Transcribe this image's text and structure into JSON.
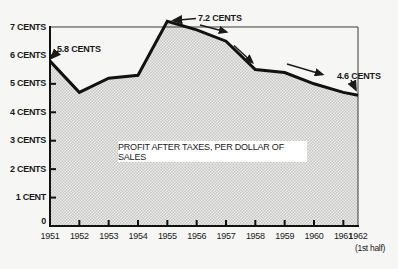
{
  "page": {
    "paper_color": "#f6f6f4",
    "ink_color": "#1a1a1a",
    "halftone_light": "#ececea",
    "halftone_dark": "#c6c6c4"
  },
  "chart_data": {
    "type": "area",
    "title": "PROFIT AFTER TAXES, PER DOLLAR OF SALES",
    "categories": [
      "1951",
      "1952",
      "1953",
      "1954",
      "1955",
      "1956",
      "1957",
      "1958",
      "1959",
      "1960",
      "1961",
      "1962"
    ],
    "values": [
      5.8,
      4.7,
      5.2,
      5.3,
      7.2,
      6.9,
      6.5,
      5.5,
      5.4,
      5.0,
      4.7,
      4.6
    ],
    "unit": "cents",
    "y_tick_labels": [
      "7 CENTS",
      "6 CENTS",
      "5 CENTS",
      "4 CENTS",
      "3 CENTS",
      "2 CENTS",
      "1 CENT"
    ],
    "y_tick_values": [
      7,
      6,
      5,
      4,
      3,
      2,
      1
    ],
    "origin_label": "0",
    "x_last_note": "(1st half)",
    "ylim": [
      0,
      7.35
    ],
    "x_last_half_step": true,
    "grid": "single top rule at 7 cents",
    "legend": "none",
    "annotations": [
      {
        "text": "5.8 CENTS",
        "target_year": "1951",
        "value": 5.8
      },
      {
        "text": "7.2 CENTS",
        "target_year": "1955",
        "value": 7.2
      },
      {
        "text": "4.6 CENTS",
        "target_year": "1962",
        "value": 4.6
      }
    ]
  }
}
